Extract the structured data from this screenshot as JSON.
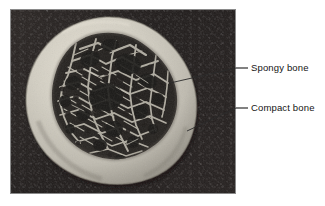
{
  "figure": {
    "kind": "labeled-photograph",
    "background_color": "#ffffff"
  },
  "photo": {
    "name": "bone-cross-section-photograph",
    "backdrop_color": "#231f1e",
    "border_color": "#7d7d7d",
    "frame": {
      "x": 10,
      "y": 9,
      "width": 226,
      "height": 185
    }
  },
  "specimen": {
    "name": "bone-specimen",
    "cortical_color": "#c9c6bc",
    "cortical_highlight": "#ded9cd",
    "cortical_shadow": "#8e8a80",
    "marrow_color": "#2a2724",
    "trabecula_color": "#b2aea3"
  },
  "callouts": [
    {
      "id": "spongy",
      "label": "Spongy bone",
      "dash": "–",
      "leader": {
        "x1": 170,
        "y1": 83,
        "x2": 236,
        "y2": 68
      },
      "target_region": "trabecular-interior"
    },
    {
      "id": "compact",
      "label": "Compact bone",
      "dash": "–",
      "leader": {
        "x1": 187,
        "y1": 131,
        "x2": 236,
        "y2": 108
      },
      "target_region": "cortical-rim"
    }
  ],
  "leader_line_color": "#2a2a2a"
}
